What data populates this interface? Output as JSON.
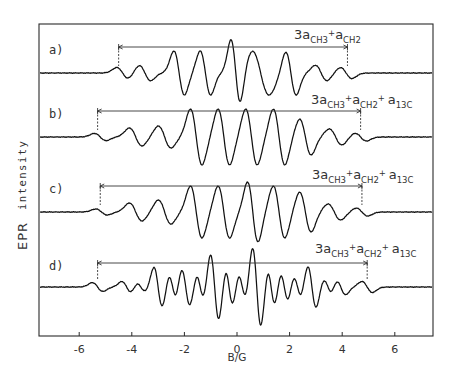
{
  "chart_data": {
    "type": "line",
    "title": "",
    "xlabel": "B/G",
    "ylabel": "EPR intensity",
    "xlim": [
      -7.5,
      7.5
    ],
    "x_ticks": [
      -6,
      -4,
      -2,
      0,
      2,
      4,
      6
    ],
    "x_tick_labels": [
      "-6",
      "-4",
      "-2",
      "0",
      "2",
      "4",
      "6"
    ],
    "grid": false,
    "legend": null,
    "series": [
      {
        "name": "a)",
        "label": "a)",
        "annotation": "3a_CH3 + a_CH2",
        "annotation_parts": {
          "main1": "3a",
          "sub1": "CH3",
          "plus1": "+",
          "main2": "a",
          "sub2": "CH2"
        },
        "range_arrow": [
          -4.5,
          4.2
        ],
        "lines": [
          {
            "pos": -4.35,
            "amp": 0.25,
            "w": 0.22
          },
          {
            "pos": -3.5,
            "amp": 0.35,
            "w": 0.22
          },
          {
            "pos": -2.2,
            "amp": 1.0,
            "w": 0.2
          },
          {
            "pos": -1.2,
            "amp": 1.0,
            "w": 0.2
          },
          {
            "pos": -0.05,
            "amp": 1.5,
            "w": 0.18
          },
          {
            "pos": 0.9,
            "amp": 1.0,
            "w": 0.32
          },
          {
            "pos": 2.05,
            "amp": 1.0,
            "w": 0.2
          },
          {
            "pos": 3.2,
            "amp": 0.35,
            "w": 0.22
          },
          {
            "pos": 4.15,
            "amp": 0.25,
            "w": 0.22
          }
        ]
      },
      {
        "name": "b)",
        "label": "b)",
        "annotation": "3a_CH3 + a_CH2 + a_13C",
        "annotation_parts": {
          "main1": "3a",
          "sub1": "CH3",
          "plus1": "+",
          "main2": "a",
          "sub2": "CH2",
          "plus2": "+",
          "main3": "a",
          "sub3": "13C"
        },
        "range_arrow": [
          -5.3,
          4.7
        ],
        "lines": [
          {
            "pos": -5.2,
            "amp": 0.18,
            "w": 0.22
          },
          {
            "pos": -3.85,
            "amp": 0.45,
            "w": 0.24
          },
          {
            "pos": -2.75,
            "amp": 0.55,
            "w": 0.24
          },
          {
            "pos": -1.55,
            "amp": 1.4,
            "w": 0.22
          },
          {
            "pos": -0.5,
            "amp": 1.4,
            "w": 0.22
          },
          {
            "pos": 0.55,
            "amp": 1.4,
            "w": 0.22
          },
          {
            "pos": 1.6,
            "amp": 1.4,
            "w": 0.22
          },
          {
            "pos": 2.6,
            "amp": 0.9,
            "w": 0.22
          },
          {
            "pos": 3.75,
            "amp": 0.4,
            "w": 0.24
          },
          {
            "pos": 4.7,
            "amp": 0.2,
            "w": 0.22
          }
        ]
      },
      {
        "name": "c)",
        "label": "c)",
        "annotation": "3a_CH3 + a_CH2 + a_13C",
        "annotation_parts": {
          "main1": "3a",
          "sub1": "CH3",
          "plus1": "+",
          "main2": "a",
          "sub2": "CH2",
          "plus2": "+",
          "main3": "a",
          "sub3": "13C"
        },
        "range_arrow": [
          -5.2,
          4.75
        ],
        "lines": [
          {
            "pos": -5.15,
            "amp": 0.15,
            "w": 0.22
          },
          {
            "pos": -3.85,
            "amp": 0.45,
            "w": 0.24
          },
          {
            "pos": -2.75,
            "amp": 0.6,
            "w": 0.24
          },
          {
            "pos": -1.55,
            "amp": 1.3,
            "w": 0.22
          },
          {
            "pos": -0.5,
            "amp": 1.3,
            "w": 0.22
          },
          {
            "pos": 0.6,
            "amp": 1.5,
            "w": 0.2
          },
          {
            "pos": 1.6,
            "amp": 1.3,
            "w": 0.22
          },
          {
            "pos": 2.6,
            "amp": 1.0,
            "w": 0.22
          },
          {
            "pos": 3.7,
            "amp": 0.4,
            "w": 0.24
          },
          {
            "pos": 4.75,
            "amp": 0.2,
            "w": 0.22
          }
        ]
      },
      {
        "name": "d)",
        "label": "d)",
        "annotation": "3a_CH3 + a_CH2 + a_13C",
        "annotation_parts": {
          "main1": "3a",
          "sub1": "CH3",
          "plus1": "+",
          "main2": "a",
          "sub2": "CH2",
          "plus2": "+",
          "main3": "a",
          "sub3": "13C"
        },
        "range_arrow": [
          -5.3,
          4.95
        ],
        "lines": [
          {
            "pos": -5.3,
            "amp": 0.2,
            "w": 0.2
          },
          {
            "pos": -4.2,
            "amp": 0.25,
            "w": 0.18
          },
          {
            "pos": -3.65,
            "amp": 0.2,
            "w": 0.16
          },
          {
            "pos": -3.0,
            "amp": 0.9,
            "w": 0.16
          },
          {
            "pos": -2.45,
            "amp": 0.55,
            "w": 0.14
          },
          {
            "pos": -1.95,
            "amp": 0.85,
            "w": 0.16
          },
          {
            "pos": -1.4,
            "amp": 0.55,
            "w": 0.14
          },
          {
            "pos": -0.85,
            "amp": 1.5,
            "w": 0.16
          },
          {
            "pos": -0.3,
            "amp": 0.8,
            "w": 0.14
          },
          {
            "pos": 0.2,
            "amp": 0.55,
            "w": 0.14
          },
          {
            "pos": 0.75,
            "amp": 1.8,
            "w": 0.16
          },
          {
            "pos": 1.3,
            "amp": 0.8,
            "w": 0.14
          },
          {
            "pos": 1.8,
            "amp": 0.6,
            "w": 0.14
          },
          {
            "pos": 2.3,
            "amp": 0.45,
            "w": 0.14
          },
          {
            "pos": 2.85,
            "amp": 0.95,
            "w": 0.16
          },
          {
            "pos": 3.45,
            "amp": 0.35,
            "w": 0.16
          },
          {
            "pos": 3.95,
            "amp": 0.35,
            "w": 0.18
          },
          {
            "pos": 4.95,
            "amp": 0.25,
            "w": 0.2
          }
        ]
      }
    ]
  },
  "axes": {
    "x_label": "B/G",
    "y_label_part1": "EPR",
    "y_label_part2": "intensity"
  },
  "panels": [
    {
      "label": "a)"
    },
    {
      "label": "b)"
    },
    {
      "label": "c)"
    },
    {
      "label": "d)"
    }
  ]
}
